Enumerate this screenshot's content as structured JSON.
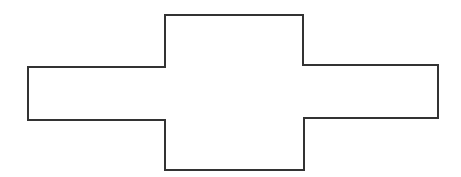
{
  "diagram": {
    "type": "polygon-outline",
    "shape_name": "cross-shaped polygon (horizontal bar with taller center block)",
    "stroke_color": "#333333",
    "fill_color": "#ffffff",
    "stroke_width": 2,
    "points": [
      [
        28,
        67
      ],
      [
        165,
        67
      ],
      [
        165,
        15
      ],
      [
        303,
        15
      ],
      [
        303,
        65
      ],
      [
        438,
        65
      ],
      [
        438,
        118
      ],
      [
        304,
        118
      ],
      [
        304,
        170
      ],
      [
        165,
        170
      ],
      [
        165,
        120
      ],
      [
        28,
        120
      ]
    ]
  }
}
